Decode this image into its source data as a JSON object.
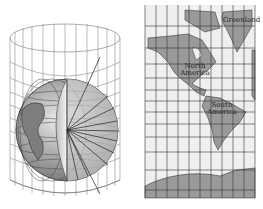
{
  "figure": {
    "left_panel": "Globe projected onto a surrounding cylinder",
    "right_panel": "Unrolled cylinder map of the Americas"
  },
  "map_labels": {
    "greenland": "Greenland",
    "north_america": "North America",
    "south_america": "South America"
  },
  "colors": {
    "land": "#9a9a9a",
    "ocean": "#eeeeee",
    "grid": "#333333",
    "cylinder_lines": "#777777"
  }
}
